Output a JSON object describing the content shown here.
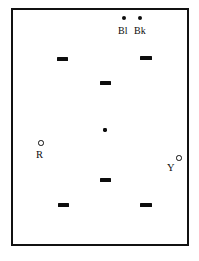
{
  "figure": {
    "background_color": "#ffffff",
    "ink_color": "#0d0d0d",
    "frame": {
      "name": "plot-frame",
      "x": 11,
      "y": 8,
      "width": 178,
      "height": 238,
      "border_width": 2.5,
      "border_color": "#111111"
    },
    "caption": ""
  },
  "labels": [
    {
      "id": "label-bl",
      "text": "Bl",
      "x": 118,
      "y": 26,
      "style": "top"
    },
    {
      "id": "label-bk",
      "text": "Bk",
      "x": 134,
      "y": 26,
      "style": "top"
    },
    {
      "id": "label-r",
      "text": "R",
      "x": 36,
      "y": 150,
      "style": "side"
    },
    {
      "id": "label-y",
      "text": "Y",
      "x": 167,
      "y": 163,
      "style": "side"
    }
  ],
  "markers": [
    {
      "id": "dot-bl",
      "kind": "dot",
      "x": 122,
      "y": 16,
      "w": 4,
      "h": 4
    },
    {
      "id": "dot-bk",
      "kind": "dot",
      "x": 138,
      "y": 16,
      "w": 4,
      "h": 4
    },
    {
      "id": "dash-upper-left",
      "kind": "dash",
      "x": 57,
      "y": 57,
      "w": 11,
      "h": 3.5
    },
    {
      "id": "dash-upper-right",
      "kind": "dash",
      "x": 140,
      "y": 56,
      "w": 12,
      "h": 3.5
    },
    {
      "id": "dash-mid-upper",
      "kind": "dash",
      "x": 100,
      "y": 81,
      "w": 11,
      "h": 3.5
    },
    {
      "id": "point-center",
      "kind": "point",
      "x": 103,
      "y": 128,
      "w": 3.5,
      "h": 3.5
    },
    {
      "id": "ring-r",
      "kind": "ring",
      "x": 38,
      "y": 140,
      "w": 5.5,
      "h": 5.5
    },
    {
      "id": "ring-y",
      "kind": "ring",
      "x": 176,
      "y": 155,
      "w": 5.5,
      "h": 5.5
    },
    {
      "id": "dash-mid-lower",
      "kind": "dash",
      "x": 100,
      "y": 178,
      "w": 11,
      "h": 3.5
    },
    {
      "id": "dash-lower-left",
      "kind": "dash",
      "x": 58,
      "y": 203,
      "w": 11,
      "h": 3.5
    },
    {
      "id": "dash-lower-right",
      "kind": "dash",
      "x": 140,
      "y": 203,
      "w": 12,
      "h": 3.5
    }
  ],
  "chart_data": {
    "type": "scatter",
    "title": "",
    "subtitle": "",
    "xlabel": "",
    "ylabel": "",
    "grid": false,
    "legend_position": "none",
    "axis_ticks": false,
    "xlim": [
      0,
      178
    ],
    "ylim": [
      0,
      238
    ],
    "note": "Schematic plot frame with unlabeled axes; markers given in pixel coordinates relative to the page, measured from the rendered figure.",
    "series": [
      {
        "name": "Bl",
        "marker": "filled-circle",
        "label_text": "Bl",
        "points": [
          {
            "x": 124,
            "y": 18
          }
        ]
      },
      {
        "name": "Bk",
        "marker": "filled-circle",
        "label_text": "Bk",
        "points": [
          {
            "x": 140,
            "y": 18
          }
        ]
      },
      {
        "name": "R",
        "marker": "open-circle",
        "label_text": "R",
        "points": [
          {
            "x": 41,
            "y": 143
          }
        ]
      },
      {
        "name": "Y",
        "marker": "open-circle",
        "label_text": "Y",
        "points": [
          {
            "x": 179,
            "y": 158
          }
        ]
      },
      {
        "name": "dashes",
        "marker": "horizontal-bar",
        "label_text": "",
        "points": [
          {
            "x": 62,
            "y": 59
          },
          {
            "x": 146,
            "y": 58
          },
          {
            "x": 105,
            "y": 83
          },
          {
            "x": 105,
            "y": 180
          },
          {
            "x": 63,
            "y": 205
          },
          {
            "x": 146,
            "y": 205
          }
        ]
      },
      {
        "name": "center-point",
        "marker": "small-filled-square",
        "label_text": "",
        "points": [
          {
            "x": 105,
            "y": 130
          }
        ]
      }
    ]
  }
}
